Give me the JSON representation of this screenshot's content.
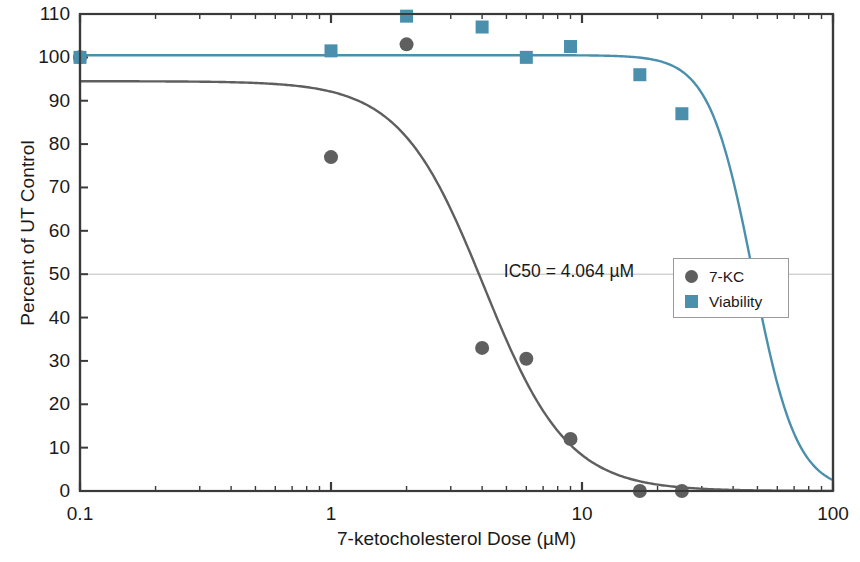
{
  "chart_data": {
    "type": "scatter",
    "title": "",
    "xlabel": "7-ketocholesterol Dose (µM)",
    "ylabel": "Percent of UT Control",
    "xscale": "log",
    "xlim": [
      0.1,
      100
    ],
    "ylim": [
      0,
      110
    ],
    "xticks": [
      "0.1",
      "1",
      "10",
      "100"
    ],
    "xtick_values": [
      0.1,
      1,
      10,
      100
    ],
    "yticks": [
      "0",
      "10",
      "20",
      "30",
      "40",
      "50",
      "60",
      "70",
      "80",
      "90",
      "100",
      "110"
    ],
    "ytick_values": [
      0,
      10,
      20,
      30,
      40,
      50,
      60,
      70,
      80,
      90,
      100,
      110
    ],
    "grid": "50% reference line only",
    "legend_position": "right-middle",
    "annotations": [
      {
        "text": "IC50 = 4.064 µM",
        "x": 4.064,
        "y": 50
      }
    ],
    "series": [
      {
        "name": "7-KC",
        "marker": "circle",
        "color": "#5f5f5f",
        "points": [
          {
            "x": 0.1,
            "y": 100.0
          },
          {
            "x": 1.0,
            "y": 77.0
          },
          {
            "x": 2.0,
            "y": 103.0
          },
          {
            "x": 4.0,
            "y": 33.0
          },
          {
            "x": 6.0,
            "y": 30.5
          },
          {
            "x": 9.0,
            "y": 12.0
          },
          {
            "x": 17.0,
            "y": 0.0
          },
          {
            "x": 25.0,
            "y": 0.0
          }
        ],
        "fit_curve": {
          "model": "4-parameter logistic",
          "top": 94.5,
          "bottom": 0.0,
          "ic50": 4.064,
          "hill": 2.6
        }
      },
      {
        "name": "Viability",
        "marker": "square",
        "color": "#4a90ad",
        "points": [
          {
            "x": 0.1,
            "y": 100.0
          },
          {
            "x": 1.0,
            "y": 101.5
          },
          {
            "x": 2.0,
            "y": 109.5
          },
          {
            "x": 4.0,
            "y": 107.0
          },
          {
            "x": 6.0,
            "y": 100.0
          },
          {
            "x": 9.0,
            "y": 102.5
          },
          {
            "x": 17.0,
            "y": 96.0
          },
          {
            "x": 25.0,
            "y": 87.0
          }
        ],
        "fit_curve": {
          "model": "4-parameter logistic",
          "top": 100.5,
          "bottom": 0.0,
          "ic50": 48.0,
          "hill": 5.0
        }
      }
    ]
  },
  "legend": {
    "items": [
      {
        "label": "7-KC",
        "marker": "circle",
        "color": "#5f5f5f"
      },
      {
        "label": "Viability",
        "marker": "square",
        "color": "#4a90ad"
      }
    ]
  },
  "colors": {
    "axis": "#3a3a3a",
    "series_7kc": "#5f5f5f",
    "series_viability": "#4a90ad",
    "reference_line": "#bdbdbd",
    "background": "#ffffff"
  }
}
